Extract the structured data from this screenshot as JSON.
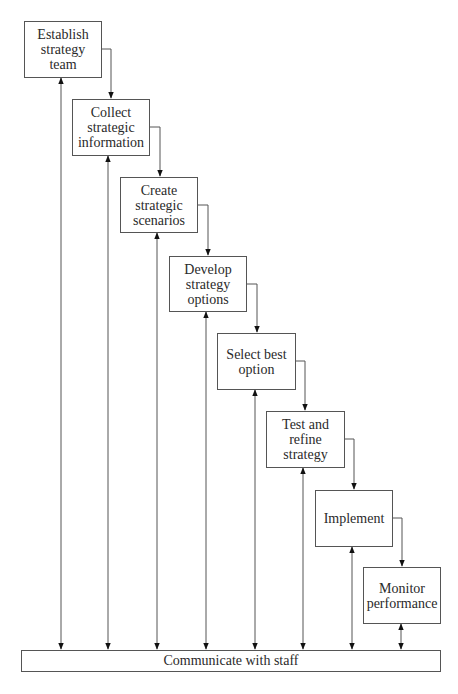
{
  "diagram": {
    "type": "staircase process flow",
    "steps": [
      {
        "label": "Establish strategy team",
        "lines": [
          "Establish",
          "strategy",
          "team"
        ]
      },
      {
        "label": "Collect strategic information",
        "lines": [
          "Collect",
          "strategic",
          "information"
        ]
      },
      {
        "label": "Create strategic scenarios",
        "lines": [
          "Create",
          "strategic",
          "scenarios"
        ]
      },
      {
        "label": "Develop strategy options",
        "lines": [
          "Develop",
          "strategy",
          "options"
        ]
      },
      {
        "label": "Select best option",
        "lines": [
          "Select best",
          "option"
        ]
      },
      {
        "label": "Test and refine strategy",
        "lines": [
          "Test and",
          "refine",
          "strategy"
        ]
      },
      {
        "label": "Implement",
        "lines": [
          "Implement"
        ]
      },
      {
        "label": "Monitor performance",
        "lines": [
          "Monitor",
          "performance"
        ]
      }
    ],
    "base_bar": {
      "label": "Communicate with staff"
    },
    "connections": "each step flows to the next; each step has a bidirectional arrow to 'Communicate with staff'"
  }
}
